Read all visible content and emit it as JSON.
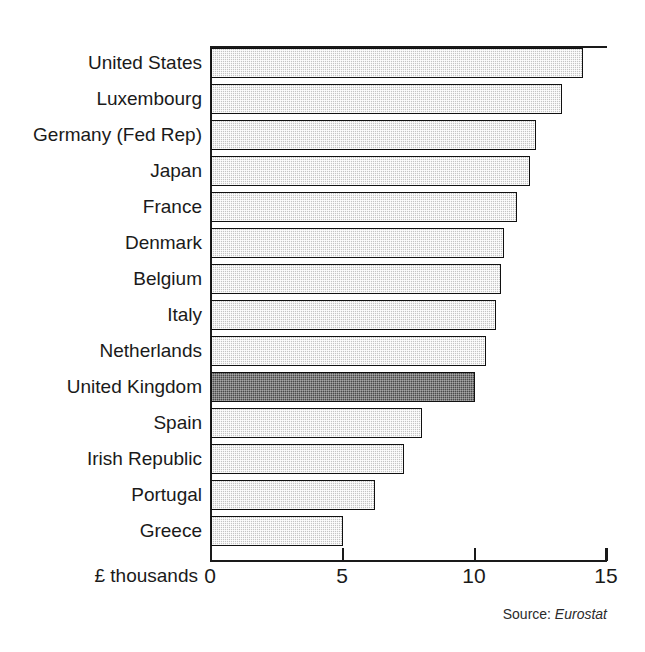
{
  "chart_data": {
    "type": "bar",
    "orientation": "horizontal",
    "title": "",
    "xlabel": "£ thousands",
    "ylabel": "",
    "xlim": [
      0,
      15
    ],
    "xticks": [
      "0",
      "5",
      "10",
      "15"
    ],
    "xtick_values": [
      0,
      5,
      10,
      15
    ],
    "grid": false,
    "legend": false,
    "categories": [
      "United States",
      "Luxembourg",
      "Germany (Fed Rep)",
      "Japan",
      "France",
      "Denmark",
      "Belgium",
      "Italy",
      "Netherlands",
      "United Kingdom",
      "Spain",
      "Irish Republic",
      "Portugal",
      "Greece"
    ],
    "values": [
      14.1,
      13.3,
      12.3,
      12.1,
      11.6,
      11.1,
      11.0,
      10.8,
      10.4,
      10.0,
      8.0,
      7.3,
      6.2,
      5.0
    ],
    "highlight_category": "United Kingdom",
    "highlight_index": 9,
    "bar_fill_color": "#c4c4c4",
    "bar_highlight_color": "#4a4a4a",
    "bar_edge_color": "#111111",
    "source_label": "Source:",
    "source_value": "Eurostat"
  },
  "axis": {
    "x_title": "£ thousands"
  },
  "source": {
    "label": "Source:",
    "value": "Eurostat"
  }
}
